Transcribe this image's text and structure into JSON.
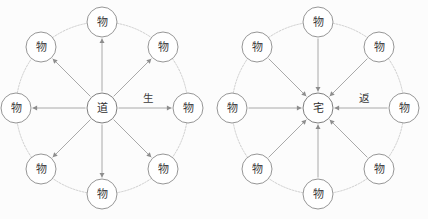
{
  "figure": {
    "background_color": "#fcfcfc",
    "width": 428,
    "height": 219,
    "stroke_color": "#8d8d8d",
    "ring_color": "#b9b9b9",
    "node_fill": "#ffffff",
    "text_color": "#3a3a3a"
  },
  "diagrams": [
    {
      "id": "left-diagram",
      "name": "outward-emanation-diagram",
      "center": {
        "label": "道",
        "cx": 102,
        "cy": 108,
        "r": 15
      },
      "edge_label": {
        "text": "生",
        "x": 148,
        "y": 98
      },
      "arrow_direction": "outward",
      "ring_radius": 86,
      "node_radius": 15,
      "nodes": [
        {
          "label": "物",
          "angle": 90,
          "cx": 102,
          "cy": 22
        },
        {
          "label": "物",
          "angle": 45,
          "cx": 163,
          "cy": 47
        },
        {
          "label": "物",
          "angle": 0,
          "cx": 188,
          "cy": 108
        },
        {
          "label": "物",
          "angle": -45,
          "cx": 163,
          "cy": 169
        },
        {
          "label": "物",
          "angle": -90,
          "cx": 102,
          "cy": 194
        },
        {
          "label": "物",
          "angle": -135,
          "cx": 41,
          "cy": 169
        },
        {
          "label": "物",
          "angle": 180,
          "cx": 16,
          "cy": 108
        },
        {
          "label": "物",
          "angle": 135,
          "cx": 41,
          "cy": 47
        }
      ]
    },
    {
      "id": "right-diagram",
      "name": "inward-return-diagram",
      "center": {
        "label": "宅",
        "cx": 318,
        "cy": 108,
        "r": 15
      },
      "edge_label": {
        "text": "返",
        "x": 364,
        "y": 98
      },
      "arrow_direction": "inward",
      "ring_radius": 86,
      "node_radius": 15,
      "nodes": [
        {
          "label": "物",
          "angle": 90,
          "cx": 318,
          "cy": 22
        },
        {
          "label": "物",
          "angle": 45,
          "cx": 379,
          "cy": 47
        },
        {
          "label": "物",
          "angle": 0,
          "cx": 404,
          "cy": 108
        },
        {
          "label": "物",
          "angle": -45,
          "cx": 379,
          "cy": 169
        },
        {
          "label": "物",
          "angle": -90,
          "cx": 318,
          "cy": 194
        },
        {
          "label": "物",
          "angle": -135,
          "cx": 257,
          "cy": 169
        },
        {
          "label": "物",
          "angle": 180,
          "cx": 232,
          "cy": 108
        },
        {
          "label": "物",
          "angle": 135,
          "cx": 257,
          "cy": 47
        }
      ]
    }
  ]
}
